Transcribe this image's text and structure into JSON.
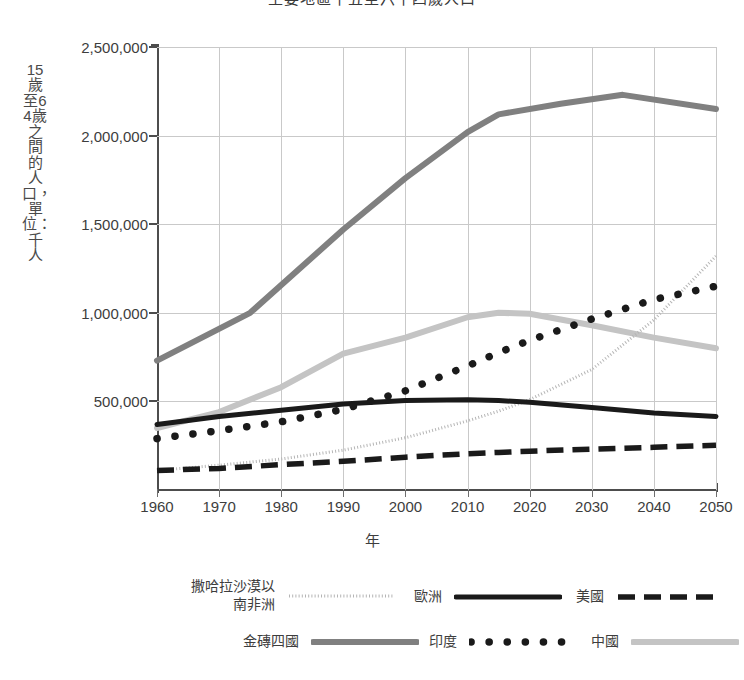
{
  "chart_data": {
    "type": "line",
    "title": "主要地區十五至六十四歲人口",
    "xlabel": "年",
    "ylabel": "15歲至64歲之間的人口，單位：千人",
    "x": [
      1960,
      1970,
      1980,
      1990,
      2000,
      2010,
      2020,
      2030,
      2040,
      2050
    ],
    "xlim": [
      1960,
      2050
    ],
    "ylim": [
      0,
      2500000
    ],
    "yticks": [
      500000,
      1000000,
      1500000,
      2000000,
      2500000
    ],
    "ytick_labels": [
      "500,000",
      "1,000,000",
      "1,500,000",
      "2,000,000",
      "2,500,000"
    ],
    "xtick_labels": [
      "1960",
      "1970",
      "1980",
      "1990",
      "2000",
      "2010",
      "2020",
      "2030",
      "2040",
      "2050"
    ],
    "grid": true,
    "legend_position": "bottom",
    "series": [
      {
        "name": "撒哈拉沙漠以南非洲",
        "style": "fine-dotted",
        "color": "#b5b5b5",
        "x": [
          1960,
          1970,
          1980,
          1990,
          2000,
          2010,
          2015,
          2020,
          2030,
          2040,
          2050
        ],
        "values": [
          110000,
          140000,
          175000,
          225000,
          295000,
          390000,
          445000,
          510000,
          680000,
          960000,
          1320000
        ]
      },
      {
        "name": "歐洲",
        "style": "solid",
        "color": "#1a1a1a",
        "x": [
          1960,
          1970,
          1980,
          1990,
          2000,
          2010,
          2015,
          2020,
          2030,
          2040,
          2050
        ],
        "values": [
          370000,
          415000,
          450000,
          485000,
          505000,
          510000,
          505000,
          495000,
          465000,
          435000,
          415000
        ]
      },
      {
        "name": "美國",
        "style": "dashed",
        "color": "#1a1a1a",
        "x": [
          1960,
          1970,
          1980,
          1990,
          2000,
          2010,
          2015,
          2020,
          2030,
          2040,
          2050
        ],
        "values": [
          110000,
          122000,
          143000,
          162000,
          185000,
          205000,
          212000,
          219000,
          231000,
          241000,
          252000
        ]
      },
      {
        "name": "金磚四國",
        "style": "thick-solid",
        "color": "#808080",
        "x": [
          1960,
          1975,
          1990,
          2000,
          2010,
          2015,
          2025,
          2035,
          2050
        ],
        "values": [
          730000,
          1000000,
          1470000,
          1760000,
          2020000,
          2120000,
          2180000,
          2230000,
          2150000
        ]
      },
      {
        "name": "印度",
        "style": "dotted-large",
        "color": "#1a1a1a",
        "x": [
          1960,
          1970,
          1980,
          1990,
          2000,
          2010,
          2015,
          2020,
          2030,
          2040,
          2050
        ],
        "values": [
          290000,
          335000,
          385000,
          455000,
          560000,
          700000,
          775000,
          845000,
          965000,
          1075000,
          1150000
        ]
      },
      {
        "name": "中國",
        "style": "solid-light",
        "color": "#c4c4c4",
        "x": [
          1960,
          1970,
          1980,
          1990,
          2000,
          2010,
          2015,
          2020,
          2030,
          2040,
          2050
        ],
        "values": [
          350000,
          440000,
          580000,
          770000,
          860000,
          975000,
          1000000,
          995000,
          930000,
          860000,
          800000
        ]
      }
    ]
  },
  "legend": {
    "items": [
      {
        "label": "撒哈拉沙漠以南非洲",
        "style": "fine-dotted",
        "color": "#b5b5b5"
      },
      {
        "label": "歐洲",
        "style": "solid",
        "color": "#1a1a1a"
      },
      {
        "label": "美國",
        "style": "dashed",
        "color": "#1a1a1a"
      },
      {
        "label": "金磚四國",
        "style": "thick-solid",
        "color": "#808080"
      },
      {
        "label": "印度",
        "style": "dotted-large",
        "color": "#1a1a1a"
      },
      {
        "label": "中國",
        "style": "solid-light",
        "color": "#c4c4c4"
      }
    ]
  }
}
